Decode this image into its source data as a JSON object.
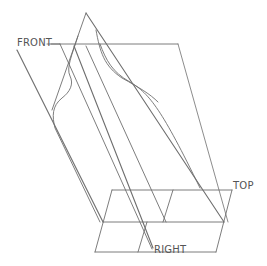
{
  "diagram": {
    "type": "3D CAD reference planes with sketch profile",
    "labels": {
      "front": "FRONT",
      "top": "TOP",
      "right": "RIGHT"
    },
    "colors": {
      "background": "#ffffff",
      "line": "#6e6e6e",
      "label": "#555555"
    }
  }
}
